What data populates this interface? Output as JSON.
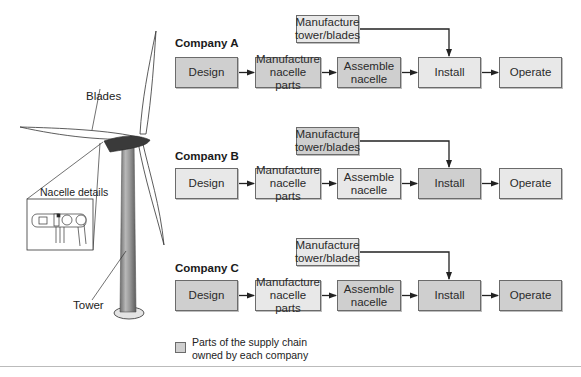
{
  "turbine": {
    "labels": {
      "blades": "Blades",
      "nacelle_details": "Nacelle details",
      "tower": "Tower"
    }
  },
  "companies": [
    {
      "name": "Company A",
      "steps": [
        {
          "label": "Design",
          "owned": true
        },
        {
          "label": "Manufacture nacelle parts",
          "owned": true
        },
        {
          "label": "Assemble nacelle",
          "owned": true
        },
        {
          "label": "Install",
          "owned": false
        },
        {
          "label": "Operate",
          "owned": false
        }
      ],
      "side_step": {
        "label": "Manufacture tower/blades",
        "owned": false
      }
    },
    {
      "name": "Company B",
      "steps": [
        {
          "label": "Design",
          "owned": false
        },
        {
          "label": "Manufacture nacelle parts",
          "owned": false
        },
        {
          "label": "Assemble nacelle",
          "owned": false
        },
        {
          "label": "Install",
          "owned": true
        },
        {
          "label": "Operate",
          "owned": false
        }
      ],
      "side_step": {
        "label": "Manufacture tower/blades",
        "owned": true
      }
    },
    {
      "name": "Company C",
      "steps": [
        {
          "label": "Design",
          "owned": true
        },
        {
          "label": "Manufacture nacelle parts",
          "owned": false
        },
        {
          "label": "Assemble nacelle",
          "owned": true
        },
        {
          "label": "Install",
          "owned": true
        },
        {
          "label": "Operate",
          "owned": true
        }
      ],
      "side_step": {
        "label": "Manufacture tower/blades",
        "owned": false
      }
    }
  ],
  "legend": {
    "text_line1": "Parts of the supply chain",
    "text_line2": "owned by each company"
  },
  "colors": {
    "owned": "#cfcfcf",
    "not_owned": "#e8e8e8",
    "border": "#6b6b6b",
    "arrow": "#222222"
  }
}
